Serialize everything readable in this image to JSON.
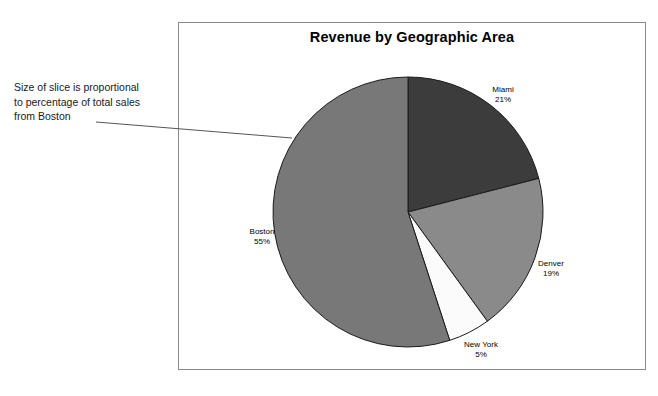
{
  "chart": {
    "title": "Revenue by Geographic Area"
  },
  "annotation": {
    "line1": "Size of slice is proportional",
    "line2": "to percentage of total sales",
    "line3": "from Boston"
  },
  "labels": {
    "miami": {
      "name": "Miami",
      "pct": "21%"
    },
    "denver": {
      "name": "Denver",
      "pct": "19%"
    },
    "newyork": {
      "name": "New York",
      "pct": "5%"
    },
    "boston": {
      "name": "Boston",
      "pct": "55%"
    }
  },
  "colors": {
    "miami": "#3c3c3c",
    "denver": "#8a8a8a",
    "newyork": "#fbfbfb",
    "boston": "#787878",
    "outline": "#1a1a1a",
    "frame": "#8a8a8a",
    "leader": "#555555"
  },
  "chart_data": {
    "type": "pie",
    "title": "Revenue by Geographic Area",
    "categories": [
      "Miami",
      "Denver",
      "New York",
      "Boston"
    ],
    "values": [
      21,
      19,
      5,
      55
    ],
    "unit": "percent",
    "total": 100,
    "start_angle_deg": 0,
    "direction": "clockwise",
    "slice_colors": [
      "#3c3c3c",
      "#8a8a8a",
      "#fbfbfb",
      "#787878"
    ],
    "labels_shown": [
      "Miami 21%",
      "Denver 19%",
      "New York 5%",
      "Boston 55%"
    ],
    "label_position": "outside",
    "legend": "none",
    "grid": false,
    "xlabel": "",
    "ylabel": "",
    "annotations": [
      "Size of slice is proportional to percentage of total sales from Boston"
    ]
  }
}
